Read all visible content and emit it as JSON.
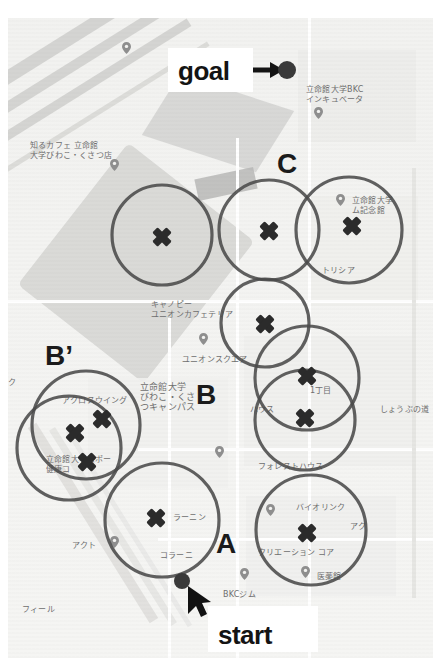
{
  "figure": {
    "type": "annotated-map",
    "background_color": "#f4f4f2",
    "annotation_color": "#4a4a4a",
    "marker_color": "#2b2b2b"
  },
  "annotations": {
    "goal_label": "goal",
    "start_label": "start",
    "cluster_labels": [
      {
        "id": "A",
        "label": "A",
        "x": 224,
        "y": 545
      },
      {
        "id": "B",
        "label": "B",
        "x": 198,
        "y": 396
      },
      {
        "id": "Bp",
        "label": "B’",
        "x": 48,
        "y": 358
      },
      {
        "id": "C",
        "label": "C",
        "x": 277,
        "y": 165
      }
    ],
    "goal_point": {
      "x": 287,
      "y": 70
    },
    "start_point": {
      "x": 182,
      "y": 581
    }
  },
  "coverage_circles": [
    {
      "name": "circle-1",
      "cx": 162,
      "cy": 235,
      "r": 50
    },
    {
      "name": "circle-2",
      "cx": 269,
      "cy": 230,
      "r": 50
    },
    {
      "name": "circle-3",
      "cx": 349,
      "cy": 230,
      "r": 53
    },
    {
      "name": "circle-4",
      "cx": 265,
      "cy": 323,
      "r": 44
    },
    {
      "name": "circle-5",
      "cx": 307,
      "cy": 378,
      "r": 52
    },
    {
      "name": "circle-6",
      "cx": 305,
      "cy": 420,
      "r": 50
    },
    {
      "name": "circle-7",
      "cx": 86,
      "cy": 425,
      "r": 54
    },
    {
      "name": "circle-8",
      "cx": 69,
      "cy": 448,
      "r": 52
    },
    {
      "name": "circle-9",
      "cx": 162,
      "cy": 520,
      "r": 57
    },
    {
      "name": "circle-10",
      "cx": 311,
      "cy": 530,
      "r": 55
    }
  ],
  "x_markers": [
    {
      "name": "marker-1",
      "x": 162,
      "y": 237
    },
    {
      "name": "marker-2",
      "x": 269,
      "y": 231
    },
    {
      "name": "marker-3",
      "x": 352,
      "y": 226
    },
    {
      "name": "marker-4",
      "x": 265,
      "y": 324
    },
    {
      "name": "marker-5",
      "x": 307,
      "y": 376
    },
    {
      "name": "marker-6",
      "x": 305,
      "y": 418
    },
    {
      "name": "marker-7",
      "x": 75,
      "y": 433
    },
    {
      "name": "marker-8",
      "x": 102,
      "y": 419
    },
    {
      "name": "marker-9",
      "x": 87,
      "y": 462
    },
    {
      "name": "marker-10",
      "x": 156,
      "y": 518
    },
    {
      "name": "marker-11",
      "x": 307,
      "y": 533
    }
  ],
  "map_labels": [
    {
      "name": "label-incubator",
      "text": "立命館大学BKC\nインキュベータ",
      "x": 306,
      "y": 85,
      "size": 8
    },
    {
      "name": "label-shirucafe",
      "text": "知るカフェ 立命館\n大学びわこ・くさつ店",
      "x": 30,
      "y": 141,
      "size": 8
    },
    {
      "name": "label-memorial-hall",
      "text": "立命館大学\nム記念館",
      "x": 352,
      "y": 196,
      "size": 8
    },
    {
      "name": "label-trysia",
      "text": "トリシア",
      "x": 322,
      "y": 266,
      "size": 8
    },
    {
      "name": "label-canopy",
      "text": "キャノピー\nユニオンカフェテリア",
      "x": 151,
      "y": 300,
      "size": 8
    },
    {
      "name": "label-union-square",
      "text": "ユニオンスクエア",
      "x": 182,
      "y": 355,
      "size": 8
    },
    {
      "name": "label-ku",
      "text": "ク",
      "x": 8,
      "y": 378,
      "size": 8
    },
    {
      "name": "label-bkc-campus",
      "text": "立命館大学\nびわこ・くさ\nつキャンパス",
      "x": 140,
      "y": 382,
      "size": 9
    },
    {
      "name": "label-across-wing",
      "text": "アクロスウイング",
      "x": 62,
      "y": 396,
      "size": 8
    },
    {
      "name": "label-1chome",
      "text": "1丁目",
      "x": 310,
      "y": 386,
      "size": 8
    },
    {
      "name": "label-hausu",
      "text": "ハウス",
      "x": 250,
      "y": 405,
      "size": 8
    },
    {
      "name": "label-shoubu",
      "text": "しょうぶの道",
      "x": 380,
      "y": 405,
      "size": 8
    },
    {
      "name": "label-sports-health",
      "text": "立命館大学スポー\n健康コ",
      "x": 46,
      "y": 455,
      "size": 8
    },
    {
      "name": "label-forest-house",
      "text": "フォレストハウス",
      "x": 258,
      "y": 462,
      "size": 8
    },
    {
      "name": "label-biolink",
      "text": "バイオリンク",
      "x": 296,
      "y": 503,
      "size": 8
    },
    {
      "name": "label-aku",
      "text": "アク",
      "x": 350,
      "y": 522,
      "size": 8
    },
    {
      "name": "label-learning",
      "text": "ラーニン",
      "x": 173,
      "y": 513,
      "size": 8
    },
    {
      "name": "label-creation-core",
      "text": "クリエーション コア",
      "x": 258,
      "y": 548,
      "size": 8
    },
    {
      "name": "label-akuto",
      "text": "アクト",
      "x": 72,
      "y": 541,
      "size": 8
    },
    {
      "name": "label-colearning",
      "text": "コラーニ",
      "x": 160,
      "y": 551,
      "size": 8
    },
    {
      "name": "label-bkc-gym",
      "text": "BKCジム",
      "x": 223,
      "y": 590,
      "size": 8
    },
    {
      "name": "label-ikikan",
      "text": "医薬館",
      "x": 317,
      "y": 572,
      "size": 8
    },
    {
      "name": "label-field",
      "text": "フィール",
      "x": 22,
      "y": 605,
      "size": 8
    },
    {
      "name": "label-mu",
      "text": "ム",
      "x": 258,
      "y": 618,
      "size": 8
    }
  ],
  "map_pins": [
    {
      "name": "pin-incubator",
      "x": 318,
      "y": 111
    },
    {
      "name": "pin-shirucafe",
      "x": 114,
      "y": 163
    },
    {
      "name": "pin-memorial",
      "x": 340,
      "y": 198
    },
    {
      "name": "pin-union",
      "x": 203,
      "y": 337
    },
    {
      "name": "pin-rest",
      "x": 219,
      "y": 450
    },
    {
      "name": "pin-akuto",
      "x": 114,
      "y": 540
    },
    {
      "name": "pin-biolink",
      "x": 270,
      "y": 508
    },
    {
      "name": "pin-bkcgym",
      "x": 244,
      "y": 572
    },
    {
      "name": "pin-ikikan",
      "x": 305,
      "y": 570
    },
    {
      "name": "pin-dot-topleft",
      "x": 126,
      "y": 46
    }
  ]
}
